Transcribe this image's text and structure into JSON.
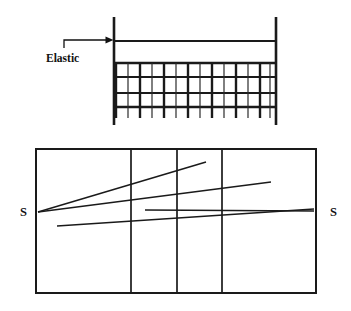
{
  "figure": {
    "title_visible": false,
    "background_color": "#ffffff",
    "ink_color": "#1a1a1a",
    "width": 351,
    "height": 311,
    "panels": [
      {
        "id": "upper-panel",
        "name": "elastic-mesh-panel",
        "description_visible": false,
        "labels": [
          {
            "id": "elastic-label",
            "text": "Elastic",
            "x": 46,
            "y": 62,
            "anchor": "start",
            "style": "bold-serif"
          }
        ],
        "callout_arrow": {
          "id": "elastic-arrow",
          "points": "64,46 64,40 108,40",
          "head_x": 113,
          "head_y": 40,
          "direction": "right"
        },
        "posts": [
          {
            "id": "left-post",
            "x": 114,
            "y1": 17,
            "y2": 125,
            "width": 2.6
          },
          {
            "id": "right-post",
            "x": 276,
            "y1": 17,
            "y2": 125,
            "width": 2.6
          }
        ],
        "top_rail": {
          "id": "elastic-rail",
          "x1": 114,
          "x2": 276,
          "y": 41,
          "width": 2.0
        },
        "mesh": {
          "id": "mesh-grid",
          "x1": 114,
          "x2": 276,
          "y_top": 63,
          "y_bottom": 107,
          "horizontal_lines_y": [
            63,
            77,
            93,
            107
          ],
          "vertical_count": 13,
          "vertical_lines_x": [
            116,
            128,
            140,
            152,
            164,
            176,
            188,
            200,
            212,
            224,
            236,
            248,
            260,
            270
          ],
          "thick_vertical_indices": [
            0,
            2,
            4,
            6,
            8,
            10,
            12
          ],
          "stub_bottom_y": 118
        }
      },
      {
        "id": "lower-panel",
        "name": "bearing-rectangle-panel",
        "rectangle": {
          "id": "main-rectangle",
          "x": 36,
          "y": 149,
          "width": 280,
          "height": 144,
          "stroke_width": 2.0
        },
        "dividers_x": [
          131,
          177,
          222
        ],
        "convergence_point": {
          "x": 40,
          "y": 211
        },
        "rays": [
          {
            "id": "ray-1",
            "x1": 38,
            "y1": 212,
            "x2": 206,
            "y2": 162
          },
          {
            "id": "ray-2",
            "x1": 38,
            "y1": 212,
            "x2": 271,
            "y2": 182
          },
          {
            "id": "ray-3",
            "x1": 145,
            "y1": 210,
            "x2": 314,
            "y2": 211
          },
          {
            "id": "ray-4",
            "x1": 57,
            "y1": 226,
            "x2": 314,
            "y2": 209
          }
        ],
        "labels": [
          {
            "id": "s-left",
            "text": "S",
            "x": 20,
            "y": 216,
            "anchor": "start"
          },
          {
            "id": "s-right",
            "text": "S",
            "x": 330,
            "y": 216,
            "anchor": "start"
          }
        ]
      }
    ]
  }
}
